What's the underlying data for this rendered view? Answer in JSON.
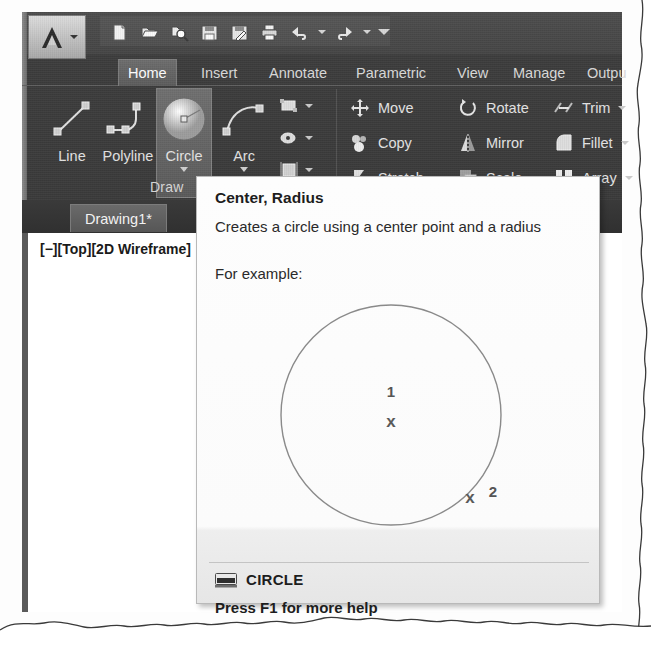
{
  "app": {
    "menu_button": "autocad-app-menu",
    "quick_access": [
      {
        "name": "new-icon",
        "label": "New"
      },
      {
        "name": "open-icon",
        "label": "Open"
      },
      {
        "name": "open-from-web-icon",
        "label": "Open from Web"
      },
      {
        "name": "save-icon",
        "label": "Save"
      },
      {
        "name": "save-as-icon",
        "label": "Save As"
      },
      {
        "name": "plot-icon",
        "label": "Plot"
      },
      {
        "name": "undo-icon",
        "label": "Undo"
      },
      {
        "name": "redo-icon",
        "label": "Redo"
      },
      {
        "name": "customize-qat-icon",
        "label": "Customize Quick Access Toolbar"
      }
    ]
  },
  "ribbon": {
    "tabs": [
      {
        "label": "Home",
        "active": true
      },
      {
        "label": "Insert",
        "active": false
      },
      {
        "label": "Annotate",
        "active": false
      },
      {
        "label": "Parametric",
        "active": false
      },
      {
        "label": "View",
        "active": false
      },
      {
        "label": "Manage",
        "active": false
      },
      {
        "label": "Outpu",
        "active": false
      }
    ],
    "draw_panel": {
      "title": "Draw",
      "buttons": [
        {
          "label": "Line",
          "icon": "line-icon",
          "selected": false,
          "has_caret": false
        },
        {
          "label": "Polyline",
          "icon": "polyline-icon",
          "selected": false,
          "has_caret": false
        },
        {
          "label": "Circle",
          "icon": "circle-icon",
          "selected": true,
          "has_caret": true
        },
        {
          "label": "Arc",
          "icon": "arc-icon",
          "selected": false,
          "has_caret": true
        }
      ],
      "small_buttons": [
        {
          "icon": "rectangle-icon",
          "label": "Rectangle"
        },
        {
          "icon": "ellipse-icon",
          "label": "Ellipse"
        },
        {
          "icon": "hatch-icon",
          "label": "Hatch"
        }
      ]
    },
    "modify_panel": {
      "commands": [
        {
          "label": "Move",
          "icon": "move-icon",
          "caret": false
        },
        {
          "label": "Rotate",
          "icon": "rotate-icon",
          "caret": false
        },
        {
          "label": "Trim",
          "icon": "trim-icon",
          "caret": true
        },
        {
          "label": "Copy",
          "icon": "copy-icon",
          "caret": false
        },
        {
          "label": "Mirror",
          "icon": "mirror-icon",
          "caret": false
        },
        {
          "label": "Fillet",
          "icon": "fillet-icon",
          "caret": true
        },
        {
          "label": "Stretch",
          "icon": "stretch-icon",
          "caret": false
        },
        {
          "label": "Scale",
          "icon": "scale-icon",
          "caret": false
        },
        {
          "label": "Array",
          "icon": "array-icon",
          "caret": true
        }
      ]
    }
  },
  "document": {
    "tab_label": "Drawing1*",
    "viewport_label": "[−][Top][2D Wireframe]"
  },
  "tooltip": {
    "title": "Center, Radius",
    "description": "Creates a circle using a center point and a radius",
    "example_label": "For example:",
    "command_name": "CIRCLE",
    "command_icon": "command-line-icon",
    "help_text": "Press F1 for more help",
    "figure": {
      "marker_1": "1",
      "marker_1_x": "x",
      "marker_2": "2",
      "marker_2_x": "x"
    }
  },
  "colors": {
    "ribbon_dark": "#3c3c3c",
    "tooltip_bg": "#fbfbfb",
    "tooltip_border": "#b9b9b9",
    "text_light": "#e2e2e2",
    "text_dark": "#1d1d1d"
  }
}
